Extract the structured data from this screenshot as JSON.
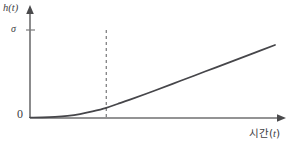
{
  "figure": {
    "name": "growth-curve-plot",
    "background_color": "#ffffff",
    "axis_color": "#6f6f70",
    "curve_color": "#46464a",
    "dashed_line_color": "#6a6a6c",
    "text_color": "#404043"
  },
  "labels": {
    "y_axis": "h(t)",
    "x_axis_prefix": "시간(",
    "x_axis_variable": "t",
    "x_axis_suffix": ")",
    "x_axis_full": "시간(t)",
    "origin": "0",
    "sigma_tick": "σ"
  },
  "chart_data": {
    "type": "line",
    "title": "",
    "xlabel": "시간(t)",
    "ylabel": "h(t)",
    "xlim": [
      0,
      10
    ],
    "ylim": [
      0,
      10
    ],
    "grid": false,
    "legend": false,
    "axis_arrows": true,
    "x_ticks": [],
    "y_ticks": [
      {
        "value": 9.1,
        "label": "σ"
      },
      {
        "value": 0,
        "label": "0"
      }
    ],
    "annotations": [
      {
        "name": "threshold-dashed-line",
        "type": "vline",
        "x": 3.05,
        "y_from": 0,
        "y_to": 9.1,
        "style": "dashed",
        "label": ""
      }
    ],
    "series": [
      {
        "name": "h(t)",
        "x": [
          0.0,
          0.5,
          1.0,
          1.5,
          2.0,
          2.5,
          3.05,
          3.5,
          4.0,
          5.0,
          6.0,
          7.0,
          8.0,
          9.0,
          9.8
        ],
        "y": [
          0.05,
          0.07,
          0.12,
          0.22,
          0.4,
          0.68,
          1.05,
          1.45,
          1.9,
          2.85,
          3.82,
          4.8,
          5.78,
          6.76,
          7.55
        ]
      }
    ]
  },
  "geometry": {
    "y_axis_x": 30,
    "x_axis_y": 118,
    "y_axis_top": 8,
    "x_axis_right": 283,
    "sigma_tick_y": 30,
    "dashed_line_x": 110,
    "curve_end_x": 275,
    "curve_end_y": 27
  }
}
